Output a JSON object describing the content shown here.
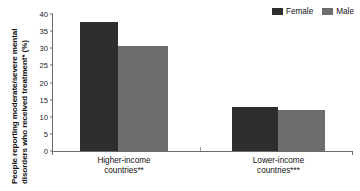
{
  "chart_data": {
    "type": "bar",
    "title": "",
    "xlabel": "",
    "ylabel": "People reporting moderate/severe mental disorders who received treatment* (%)",
    "ylabel_line1": "People reporting moderate/severe mental",
    "ylabel_line2": "disorders who received treatment* (%)",
    "categories": [
      "Higher-income countries**",
      "Lower-income countries***"
    ],
    "category_labels": [
      {
        "line1": "Higher-income",
        "line2": "countries**"
      },
      {
        "line1": "Lower-income",
        "line2": "countries***"
      }
    ],
    "series": [
      {
        "name": "Female",
        "values": [
          37.7,
          12.8
        ],
        "color": "#2e2e2e"
      },
      {
        "name": "Male",
        "values": [
          30.7,
          11.9
        ],
        "color": "#6e6e6e"
      }
    ],
    "ylim": [
      0,
      40
    ],
    "yticks": [
      0,
      5,
      10,
      15,
      20,
      25,
      30,
      35,
      40
    ],
    "ytick_labels": [
      "0",
      "5",
      "10",
      "15",
      "20",
      "25",
      "30",
      "35",
      "40"
    ],
    "grid": false,
    "legend_position": "top-right"
  },
  "legend": {
    "items": [
      {
        "label": "Female",
        "color": "#2e2e2e"
      },
      {
        "label": "Male",
        "color": "#6e6e6e"
      }
    ]
  },
  "axes": {
    "y_title_line1": "People reporting moderate/severe mental",
    "y_title_line2": "disorders who received treatment* (%)"
  }
}
